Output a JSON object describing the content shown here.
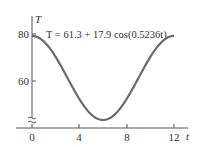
{
  "chart_data": {
    "type": "line",
    "title": "",
    "equation": "T = 61.3 + 17.9 cos(0.5236t)",
    "xlabel": "t",
    "ylabel": "T",
    "x_ticks": [
      "0",
      "4",
      "8",
      "12"
    ],
    "y_ticks": [
      "60",
      "80"
    ],
    "xlim": [
      0,
      12
    ],
    "ylim": [
      40,
      85
    ],
    "grid": false,
    "legend": "none",
    "axis_break": "y-axis broken near bottom",
    "series": [
      {
        "name": "T = 61.3 + 17.9 cos(0.5236t)",
        "x": [
          0,
          1,
          2,
          3,
          4,
          5,
          6,
          7,
          8,
          9,
          10,
          11,
          12
        ],
        "values": [
          79.2,
          76.8,
          70.2,
          61.3,
          52.4,
          45.8,
          43.4,
          45.8,
          52.4,
          61.3,
          70.2,
          76.8,
          79.2
        ]
      }
    ],
    "line_color": "#6b6b6b"
  }
}
